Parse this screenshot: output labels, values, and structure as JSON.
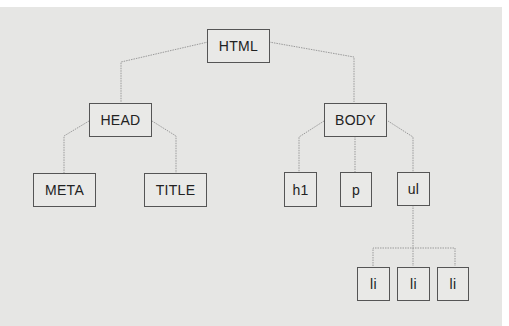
{
  "diagram": {
    "nodes": {
      "html": "HTML",
      "head": "HEAD",
      "body": "BODY",
      "meta": "META",
      "title": "TITLE",
      "h1": "h1",
      "p": "p",
      "ul": "ul",
      "li1": "li",
      "li2": "li",
      "li3": "li"
    },
    "edges": [
      [
        "HTML",
        "HEAD"
      ],
      [
        "HTML",
        "BODY"
      ],
      [
        "HEAD",
        "META"
      ],
      [
        "HEAD",
        "TITLE"
      ],
      [
        "BODY",
        "h1"
      ],
      [
        "BODY",
        "p"
      ],
      [
        "BODY",
        "ul"
      ],
      [
        "ul",
        "li"
      ],
      [
        "ul",
        "li"
      ],
      [
        "ul",
        "li"
      ]
    ],
    "colors": {
      "background": "#e6e6e4",
      "border": "#555555",
      "line": "#999999"
    }
  }
}
